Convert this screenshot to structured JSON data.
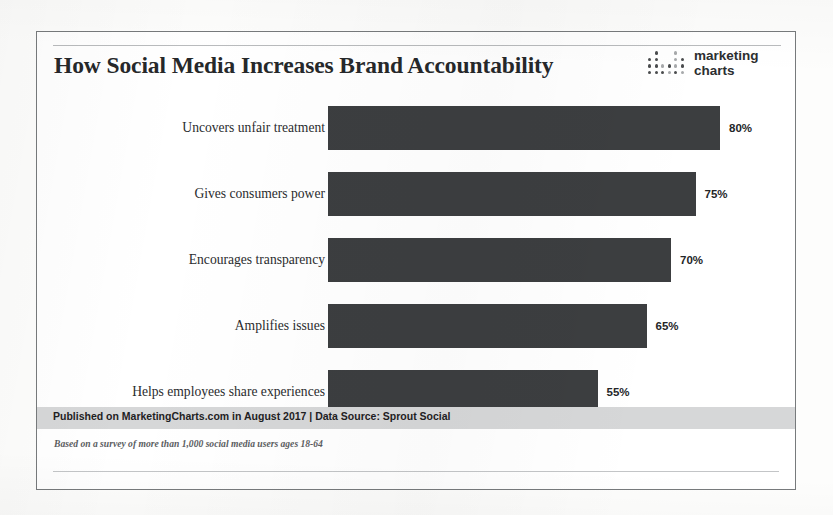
{
  "header": {
    "title": "How Social Media Increases Brand Accountability",
    "logo": {
      "line1": "marketing",
      "line2": "charts"
    }
  },
  "footer": {
    "source": "Published on MarketingCharts.com in August 2017 | Data Source: Sprout Social",
    "note": "Based on a survey of more than 1,000 social media users ages 18-64"
  },
  "colors": {
    "bar": "#3c3e40",
    "frame": "#777a7c",
    "source_band": "#d6d7d8",
    "text": "#26282a"
  },
  "chart_data": {
    "type": "bar",
    "orientation": "horizontal",
    "title": "How Social Media Increases Brand Accountability",
    "xlabel": "",
    "ylabel": "",
    "xlim": [
      0,
      80
    ],
    "grid": false,
    "legend": false,
    "categories": [
      "Uncovers unfair treatment",
      "Gives consumers power",
      "Encourages transparency",
      "Amplifies issues",
      "Helps employees share experiences"
    ],
    "values": [
      80,
      75,
      70,
      65,
      55
    ],
    "value_labels": [
      "80%",
      "75%",
      "70%",
      "65%",
      "55%"
    ]
  }
}
